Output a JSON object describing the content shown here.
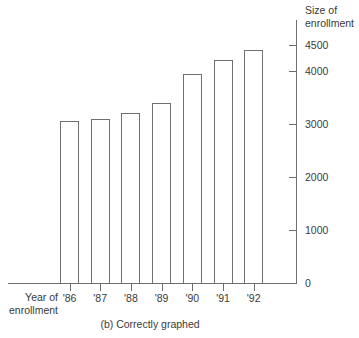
{
  "chart_data": {
    "type": "bar",
    "title": "",
    "caption": "(b) Correctly graphed",
    "xlabel": "Year of\nenrollment",
    "xlabel_line1": "Year of",
    "xlabel_line2": "enrollment",
    "ylabel": "Size of enrollment",
    "ylabel_line1": "Size of",
    "ylabel_line2": "enrollment",
    "categories": [
      "'86",
      "'87",
      "'88",
      "'89",
      "'90",
      "'91",
      "'92"
    ],
    "values": [
      3050,
      3100,
      3200,
      3400,
      3950,
      4200,
      4400
    ],
    "ylim": [
      0,
      4500
    ],
    "yticks": [
      0,
      1000,
      2000,
      3000,
      4000,
      4500
    ],
    "ytick_labels": [
      "0",
      "1000",
      "2000",
      "3000",
      "4000",
      "4500"
    ],
    "grid": false,
    "legend": false,
    "axis_position": "right",
    "bar_fill": "#ffffff",
    "bar_stroke": "#6f6f6f",
    "axis_color": "#6f6f6f",
    "text_color": "#3a3a3a",
    "background": "#ffffff"
  }
}
